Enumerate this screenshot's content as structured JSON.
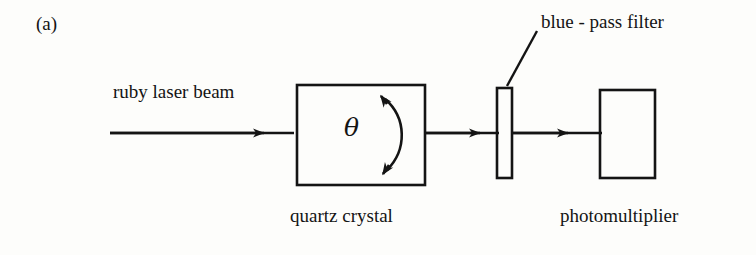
{
  "figure": {
    "panel_label": "(a)",
    "background_color": "#fdfdfb",
    "ink_color": "#141414"
  },
  "labels": {
    "ruby_laser_beam": "ruby laser beam",
    "blue_pass_filter": "blue - pass filter",
    "quartz_crystal": "quartz crystal",
    "photomultiplier": "photomultiplier",
    "theta_symbol": "θ"
  },
  "components": [
    {
      "name": "quartz-crystal-box",
      "label": "quartz crystal",
      "x": 297,
      "y": 85,
      "width": 128,
      "height": 100
    },
    {
      "name": "blue-pass-filter",
      "label": "blue - pass filter",
      "x": 497,
      "y": 88,
      "width": 15,
      "height": 90
    },
    {
      "name": "photomultiplier-box",
      "label": "photomultiplier",
      "x": 600,
      "y": 90,
      "width": 55,
      "height": 88
    }
  ],
  "beam_path": {
    "y": 133,
    "segments": [
      {
        "name": "beam-input-arrow",
        "from_x": 110,
        "to_x": 297,
        "arrowhead_x": 262
      },
      {
        "name": "beam-crystal-to-filter-arrow",
        "from_x": 425,
        "to_x": 497,
        "arrowhead_x": 478
      },
      {
        "name": "beam-filter-to-pmt-arrow",
        "from_x": 512,
        "to_x": 600,
        "arrowhead_x": 566
      }
    ]
  },
  "annotations": {
    "angle_arc": {
      "name": "theta-double-arrow",
      "description": "double-headed curved arrow indicating crystal rotation angle theta",
      "top_x": 384,
      "top_y": 92,
      "bottom_x": 384,
      "bottom_y": 176,
      "bulge_x": 408
    },
    "filter_leader_line": {
      "name": "blue-pass-filter-leader-line",
      "from_x": 507,
      "from_y": 86,
      "to_x": 537,
      "to_y": 31
    }
  }
}
